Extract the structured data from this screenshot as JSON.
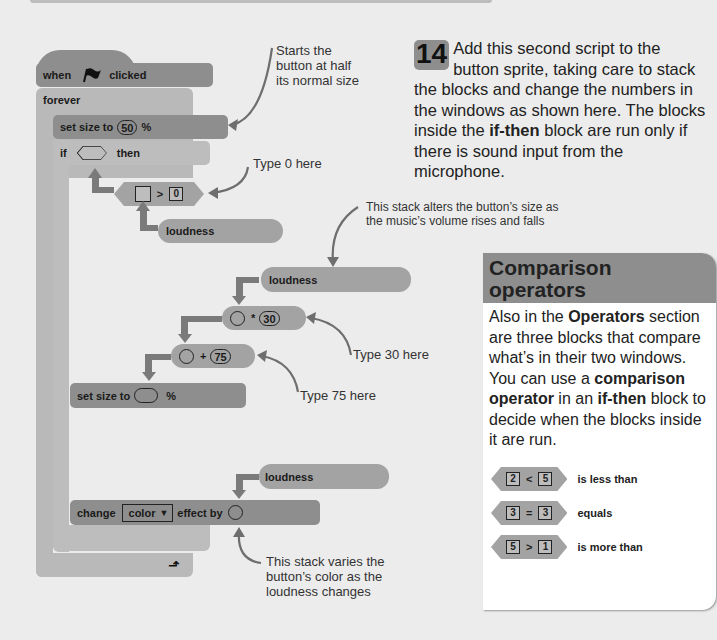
{
  "step": {
    "number": "14",
    "text_parts": [
      {
        "t": "Add this second script to the button sprite, taking care to stack the blocks and change the numbers in the windows as shown here. The blocks inside the ",
        "b": false
      },
      {
        "t": "if-then",
        "b": true
      },
      {
        "t": " block are run only if there is sound input from the microphone.",
        "b": false
      }
    ],
    "text_a": "Add this second script to the button sprite, taking care to stack the blocks and change the numbers in the windows as shown here. The blocks inside the ",
    "text_bold": "if-then",
    "text_b": " block are run only if there is sound input from the microphone."
  },
  "script": {
    "hat": {
      "when": "when",
      "clicked": "clicked",
      "icon": "green-flag-icon"
    },
    "forever": "forever",
    "set_size_1": {
      "label": "set size to",
      "value": "50",
      "unit": "%"
    },
    "if_block": {
      "if": "if",
      "then": "then"
    },
    "gt_block": {
      "op": ">",
      "right": "0"
    },
    "loudness_1": "loudness",
    "loudness_2": "loudness",
    "mul_block": {
      "op": "*",
      "right": "30"
    },
    "add_block": {
      "op": "+",
      "right": "75"
    },
    "set_size_2": {
      "label": "set size to",
      "unit": "%"
    },
    "loudness_3": "loudness",
    "change_effect": {
      "change": "change",
      "effect": "color",
      "effect_by": "effect by"
    }
  },
  "annotations": {
    "starts": "Starts the button at half its normal size",
    "starts_lines": [
      "Starts the",
      "button at half",
      "its normal size"
    ],
    "type0": "Type 0 here",
    "alters_lines": [
      "This stack alters the button’s size as",
      "the music’s volume rises and falls"
    ],
    "type30": "Type 30 here",
    "type75": "Type 75 here",
    "varies_lines": [
      "This stack varies the",
      "button’s color as the",
      "loudness changes"
    ]
  },
  "card": {
    "title_lines": [
      "Comparison",
      "operators"
    ],
    "body": {
      "p1": "Also in the ",
      "b1": "Operators",
      "p2": " section are three blocks that compare what’s in their two windows. You can use a ",
      "b2": "comparison operator",
      "p3": " in an ",
      "b3": "if-then",
      "p4": " block to decide when the blocks inside it are run."
    },
    "operators": [
      {
        "left": "2",
        "op": "<",
        "right": "5",
        "label": "is less than"
      },
      {
        "left": "3",
        "op": "=",
        "right": "3",
        "label": "equals"
      },
      {
        "left": "5",
        "op": ">",
        "right": "1",
        "label": "is more than"
      }
    ]
  },
  "colors": {
    "background": "#ececec",
    "block_dark": "#8e8e8e",
    "block_mid": "#a3a3a3",
    "block_light": "#bdbdbd",
    "arrow": "#6e6e6e"
  }
}
